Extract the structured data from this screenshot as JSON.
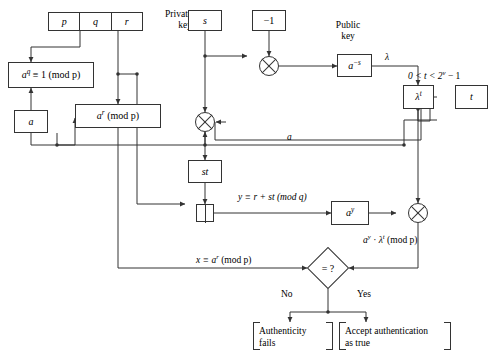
{
  "diagram": {
    "parameter_register": {
      "name": "parameter-register",
      "cells": [
        "p",
        "q",
        "r"
      ]
    },
    "labels": {
      "private_key": "Private\nkey",
      "private_key_line1": "Private",
      "private_key_line2": "key",
      "public_key_line1": "Public",
      "public_key_line2": "key",
      "lambda": "λ",
      "a_wire": "a",
      "no": "No",
      "yes": "Yes"
    },
    "nodes": {
      "order_condition": "a",
      "order_condition_sup": "q",
      "order_condition_rest": "≡ 1 (mod p)",
      "generator": "a",
      "commitment": "a",
      "commitment_sup": "r",
      "commitment_rest": "(mod p)",
      "secret": "s",
      "minus_one": "−1",
      "public_key": "a",
      "public_key_sup": "−s",
      "lambda_t": "λ",
      "lambda_t_sup": "t",
      "challenge": "t",
      "st_product": "st",
      "a_pow_y": "a",
      "a_pow_y_sup": "y",
      "compare": "= ?"
    },
    "equations": {
      "response": "y ≡ r + st (mod q)",
      "verifier_product": "aʸ · λᵗ (mod p)",
      "verifier_product_parts": {
        "a": "a",
        "a_sup": "y",
        "dot": " · ",
        "lam": "λ",
        "lam_sup": "t",
        "tail": " (mod p)"
      },
      "commitment_value": "x ≡ aʳ (mod p)",
      "commitment_value_parts": {
        "lead": "x ≡ a",
        "sup": "r",
        "tail": " (mod p)"
      },
      "challenge_range": "0 < t < 2ᵛ − 1",
      "challenge_range_parts": {
        "lead": "0 < t < 2",
        "sup": "v",
        "tail": " − 1"
      }
    },
    "outcomes": {
      "fail_line1": "Authenticity",
      "fail_line2": "fails",
      "accept_line1": "Accept authentication",
      "accept_line2": "as true"
    },
    "colors": {
      "stroke": "#333333",
      "background": "#ffffff",
      "text": "#000000"
    }
  }
}
